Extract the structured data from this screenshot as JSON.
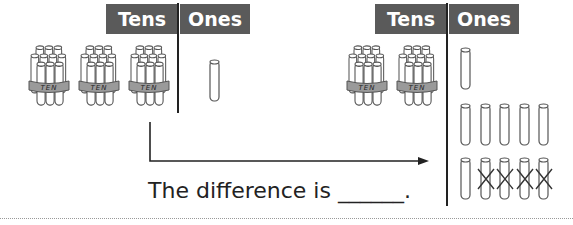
{
  "left_chart": {
    "header": {
      "tens_label": "Tens",
      "ones_label": "Ones"
    },
    "tens_bundles": 3,
    "ones_rods": 1,
    "bundle_label": "TEN"
  },
  "right_chart": {
    "header": {
      "tens_label": "Tens",
      "ones_label": "Ones"
    },
    "tens_bundles": 2,
    "ones_rods": 11,
    "crossed_out_rods": 4,
    "bundle_label": "TEN"
  },
  "caption": {
    "text": "The difference is ______."
  },
  "colors": {
    "header_bg": "#5a5a5a",
    "header_text": "#ffffff",
    "line": "#222222",
    "band": "#9a9a9a"
  }
}
